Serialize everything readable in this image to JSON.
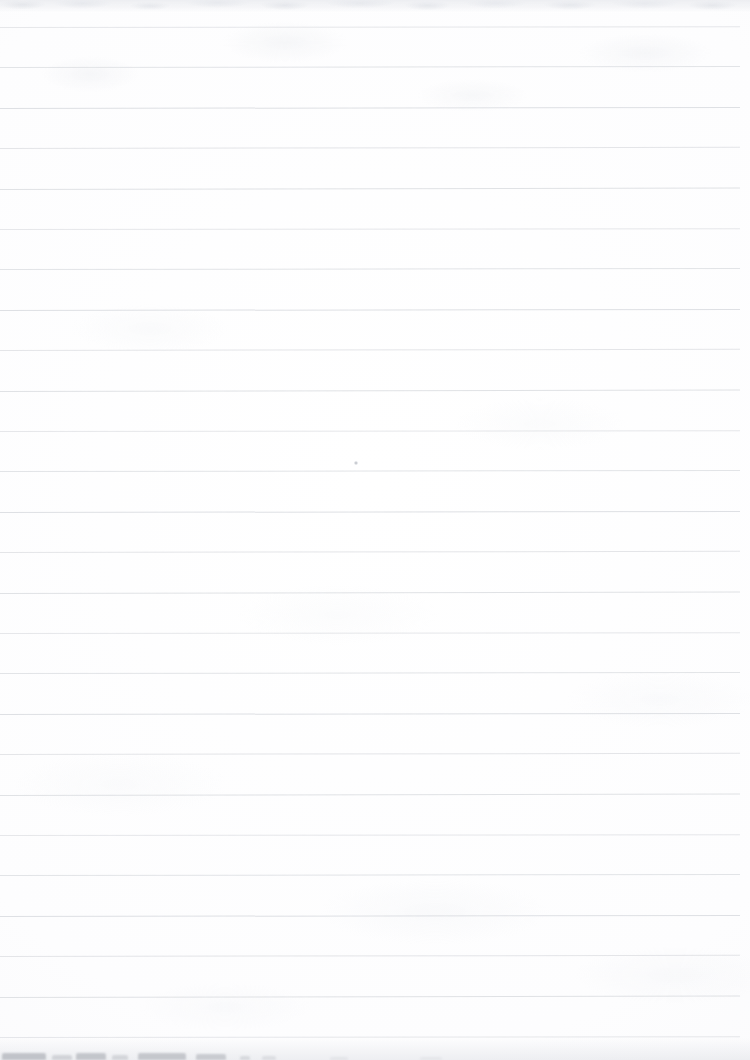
{
  "document": {
    "type": "scanned-ruled-notebook-page",
    "title": "Blank ruled page",
    "content_text": "",
    "page_width": 750,
    "page_height": 1060
  },
  "paper": {
    "background_color": "#fbfbfc",
    "edge_tone_color": "#f7f7f9",
    "texture": "faint mottled scan grain"
  },
  "ruling": {
    "line_color": "#dcdee2",
    "line_thickness": 1,
    "first_line_y": 27,
    "line_spacing": 40.4,
    "line_count": 26,
    "line_left_x": 0,
    "line_right_x": 740,
    "skew_note": "lines are very slightly tilted, dropping toward the left",
    "margin_rule": "none",
    "lines_y": [
      27,
      67,
      108,
      148,
      189,
      229,
      269,
      310,
      350,
      391,
      431,
      471,
      512,
      552,
      593,
      633,
      673,
      714,
      754,
      795,
      835,
      875,
      916,
      956,
      997,
      1037
    ]
  },
  "marks": {
    "speck": {
      "label": "small ink speck",
      "x": 354,
      "y": 461,
      "size": 4
    }
  },
  "artifacts": {
    "top_edge_noise": {
      "label": "mottled scan noise band at top trim",
      "y": 0,
      "height": 13
    },
    "bottom_bleed": {
      "label": "bleed-through smudges from next page at bottom trim",
      "y": 1046,
      "height": 14,
      "color": "#b9bcc2",
      "blobs": [
        {
          "x": 2,
          "width": 44,
          "height": 7,
          "opacity": 0.85
        },
        {
          "x": 52,
          "width": 20,
          "height": 5,
          "opacity": 0.55
        },
        {
          "x": 76,
          "width": 30,
          "height": 7,
          "opacity": 0.8
        },
        {
          "x": 112,
          "width": 16,
          "height": 5,
          "opacity": 0.5
        },
        {
          "x": 138,
          "width": 48,
          "height": 7,
          "opacity": 0.78
        },
        {
          "x": 196,
          "width": 30,
          "height": 6,
          "opacity": 0.7
        },
        {
          "x": 240,
          "width": 10,
          "height": 4,
          "opacity": 0.45
        },
        {
          "x": 262,
          "width": 14,
          "height": 4,
          "opacity": 0.35
        },
        {
          "x": 330,
          "width": 18,
          "height": 3,
          "opacity": 0.22
        },
        {
          "x": 420,
          "width": 22,
          "height": 3,
          "opacity": 0.18
        }
      ]
    }
  }
}
